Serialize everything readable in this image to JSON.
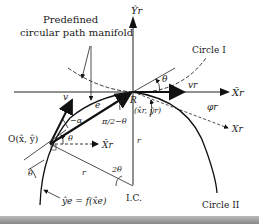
{
  "diagram": {
    "labels": {
      "manifold_line1": "Predefined",
      "manifold_line2": "circular path manifold",
      "circle1": "Circle I",
      "circle2": "Circle II",
      "yr_axis": "Ŷr",
      "xr_axis": "X̂r",
      "xr_small": "X̂r",
      "xr_rot": "Xr",
      "vr": "vr",
      "phir": "φr",
      "R": "R",
      "R_coord": "(x̂r, ŷr)",
      "theta_top": "θ",
      "v": "v",
      "e": "e",
      "alpha": "−α",
      "pi_half": "π/2−θ",
      "O": "O(x̂, ŷ)",
      "theta_mid": "θ",
      "theta_left": "θ",
      "r_left": "r",
      "r_right": "r",
      "two_theta": "2θ",
      "ic": "I.C.",
      "ye_eq": "ŷe = f(x̂e)"
    }
  }
}
